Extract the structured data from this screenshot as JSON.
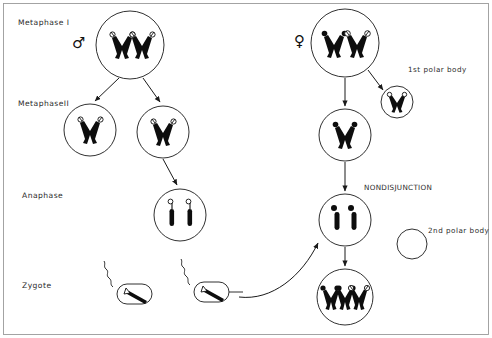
{
  "figure": {
    "title_text": "",
    "background_color": "#ffffff",
    "ink_color": "#0d0d0d",
    "border_color": "#9a9a9a",
    "width": 492,
    "height": 338
  },
  "stage_labels": [
    {
      "id": "metaphase-1",
      "text": "Metaphase I",
      "x": 18,
      "y": 25
    },
    {
      "id": "metaphase-2",
      "text": "MetaphaseII",
      "x": 18,
      "y": 106
    },
    {
      "id": "anaphase",
      "text": "Anaphase",
      "x": 22,
      "y": 198
    },
    {
      "id": "zygote",
      "text": "Zygote",
      "x": 22,
      "y": 288
    }
  ],
  "annotations": [
    {
      "id": "first-polar-body",
      "text": "1st polar body",
      "x": 408,
      "y": 72
    },
    {
      "id": "second-polar-body",
      "text": "2nd polar body",
      "x": 428,
      "y": 233
    },
    {
      "id": "nondisjunction",
      "text": "NONDISJUNCTION",
      "x": 364,
      "y": 190
    }
  ],
  "sex_symbols": [
    {
      "id": "male-symbol",
      "glyph": "♂",
      "label": "male",
      "x": 72,
      "y": 48
    },
    {
      "id": "female-symbol",
      "glyph": "♀",
      "label": "female",
      "x": 294,
      "y": 46
    }
  ],
  "cells": [
    {
      "id": "male-primary-spermatocyte",
      "label": "male primary spermatocyte",
      "cx": 130,
      "cy": 45,
      "r": 34,
      "chromosomes": "2 bivalents, open tips"
    },
    {
      "id": "male-secondary-spermatocyte-left",
      "label": "male secondary spermatocyte left",
      "cx": 90,
      "cy": 130,
      "r": 26,
      "chromosomes": "1 bivalent, open tips"
    },
    {
      "id": "male-secondary-spermatocyte-right",
      "label": "male secondary spermatocyte right",
      "cx": 163,
      "cy": 132,
      "r": 26,
      "chromosomes": "1 bivalent, open tips"
    },
    {
      "id": "male-anaphase-cell",
      "label": "male anaphase cell",
      "cx": 180,
      "cy": 215,
      "r": 26,
      "chromosomes": "2 separated chromatids"
    },
    {
      "id": "female-primary-oocyte",
      "label": "female primary oocyte",
      "cx": 345,
      "cy": 43,
      "r": 34,
      "chromosomes": "2 bivalents, one filled one open"
    },
    {
      "id": "first-polar-body-cell",
      "label": "first polar body cell",
      "cx": 397,
      "cy": 102,
      "r": 16,
      "chromosomes": "1 bivalent, open tips"
    },
    {
      "id": "female-secondary-oocyte",
      "label": "female secondary oocyte",
      "cx": 345,
      "cy": 135,
      "r": 26,
      "chromosomes": "1 bivalent, filled"
    },
    {
      "id": "female-nondisjunction-cell",
      "label": "female nondisjunction cell",
      "cx": 345,
      "cy": 220,
      "r": 26,
      "chromosomes": "2 separated chromatids"
    },
    {
      "id": "second-polar-body-cell",
      "label": "second polar body cell empty",
      "cx": 412,
      "cy": 244,
      "r": 15,
      "chromosomes": "none"
    },
    {
      "id": "zygote-cell",
      "label": "trisomic zygote",
      "cx": 345,
      "cy": 297,
      "r": 28,
      "chromosomes": "3 chromosomes, two filled one open"
    }
  ],
  "sperm": [
    {
      "id": "sperm-left",
      "label": "sperm left",
      "x": 128,
      "y": 291
    },
    {
      "id": "sperm-right",
      "label": "sperm right",
      "x": 205,
      "y": 289
    }
  ],
  "arrows": [
    {
      "id": "arrow-male-meiosis1-left",
      "from": "male-primary-spermatocyte",
      "to": "male-secondary-spermatocyte-left"
    },
    {
      "id": "arrow-male-meiosis1-right",
      "from": "male-primary-spermatocyte",
      "to": "male-secondary-spermatocyte-right"
    },
    {
      "id": "arrow-male-meiosis2",
      "from": "male-secondary-spermatocyte-right",
      "to": "male-anaphase-cell"
    },
    {
      "id": "arrow-female-meiosis1",
      "from": "female-primary-oocyte",
      "to": "female-secondary-oocyte"
    },
    {
      "id": "arrow-female-polar-body",
      "from": "female-primary-oocyte",
      "to": "first-polar-body-cell"
    },
    {
      "id": "arrow-female-meiosis2",
      "from": "female-secondary-oocyte",
      "to": "female-nondisjunction-cell"
    },
    {
      "id": "arrow-female-to-zygote",
      "from": "female-nondisjunction-cell",
      "to": "zygote-cell"
    },
    {
      "id": "arrow-fertilization",
      "from": "sperm-right",
      "to": "female-nondisjunction-cell"
    }
  ]
}
